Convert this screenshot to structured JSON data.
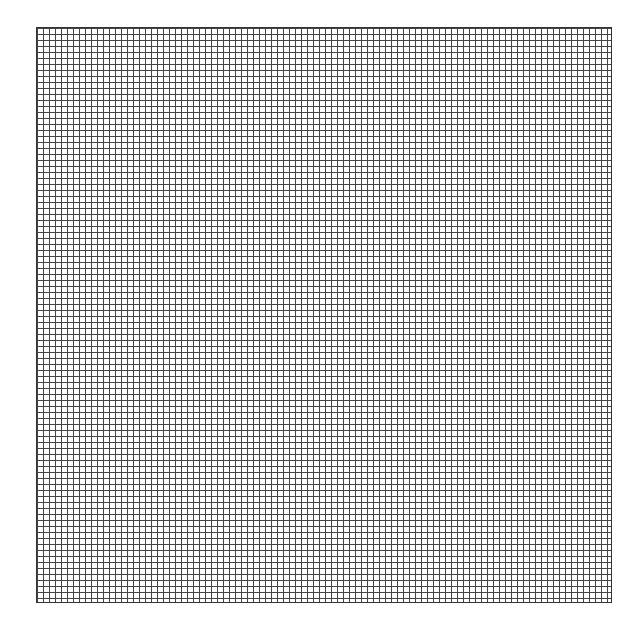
{
  "grid": {
    "rows": 96,
    "cols": 96,
    "cell_size_px": 6,
    "line_color": "#444444",
    "background": "#ffffff"
  }
}
